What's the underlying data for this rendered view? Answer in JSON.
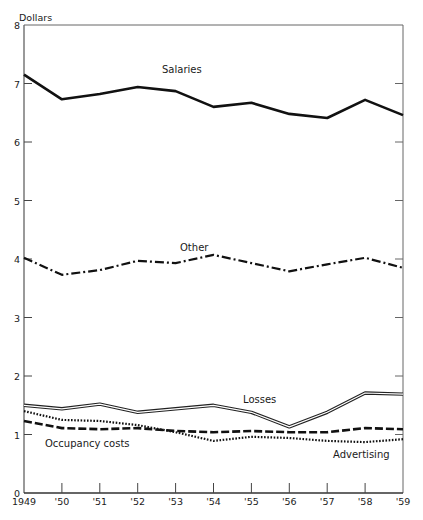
{
  "chart_data": {
    "type": "line",
    "title": "",
    "ylabel": "Dollars",
    "xlabel": "",
    "ylim": [
      0,
      8
    ],
    "yticks": [
      "0",
      "1",
      "2",
      "3",
      "4",
      "5",
      "6",
      "7",
      "8"
    ],
    "categories": [
      "1949",
      "'50",
      "'51",
      "'52",
      "'53",
      "'54",
      "'55",
      "'56",
      "'57",
      "'58",
      "'59"
    ],
    "grid": false,
    "legend": "inline labels",
    "series": [
      {
        "name": "Salaries",
        "style": "solid-thick",
        "values": [
          7.15,
          6.73,
          6.82,
          6.94,
          6.87,
          6.6,
          6.67,
          6.48,
          6.41,
          6.72,
          6.46
        ]
      },
      {
        "name": "Other",
        "style": "dash-dot",
        "values": [
          4.02,
          3.73,
          3.81,
          3.97,
          3.93,
          4.07,
          3.93,
          3.79,
          3.91,
          4.02,
          3.85
        ]
      },
      {
        "name": "Losses",
        "style": "double-line",
        "values": [
          1.5,
          1.44,
          1.52,
          1.38,
          1.44,
          1.5,
          1.38,
          1.13,
          1.38,
          1.71,
          1.69
        ]
      },
      {
        "name": "Occupancy costs",
        "style": "dashed",
        "values": [
          1.23,
          1.11,
          1.09,
          1.11,
          1.06,
          1.04,
          1.06,
          1.04,
          1.04,
          1.11,
          1.09
        ]
      },
      {
        "name": "Advertising",
        "style": "dotted",
        "values": [
          1.4,
          1.25,
          1.23,
          1.16,
          1.04,
          0.89,
          0.96,
          0.94,
          0.89,
          0.87,
          0.92
        ]
      }
    ],
    "annotations": [
      {
        "text": "Salaries",
        "series": "Salaries"
      },
      {
        "text": "Other",
        "series": "Other"
      },
      {
        "text": "Losses",
        "series": "Losses"
      },
      {
        "text": "Occupancy costs",
        "series": "Occupancy costs"
      },
      {
        "text": "Advertising",
        "series": "Advertising"
      }
    ]
  }
}
